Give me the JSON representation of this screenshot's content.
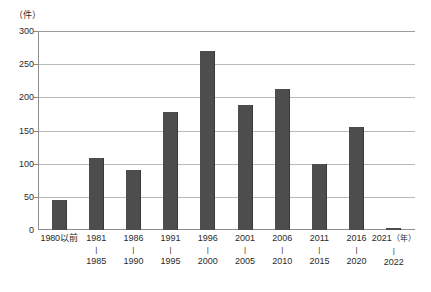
{
  "chart_data": {
    "type": "bar",
    "title": "",
    "xlabel": "（年）",
    "ylabel": "（件）",
    "ylim": [
      0,
      300
    ],
    "ytick_labels": [
      "300",
      "250",
      "200",
      "150",
      "100",
      "50",
      "0"
    ],
    "ytick_values": [
      300,
      250,
      200,
      150,
      100,
      50,
      0
    ],
    "grid": true,
    "legend": "none",
    "categories": [
      "1980以前",
      "1981\n1985",
      "1986\n1990",
      "1991\n1995",
      "1996\n2000",
      "2001\n2005",
      "2006\n2010",
      "2011\n2015",
      "2016\n2020",
      "2021\n2022"
    ],
    "values": [
      45,
      109,
      91,
      178,
      270,
      189,
      213,
      99,
      155,
      3
    ]
  },
  "axis": {
    "y_unit": "（件）",
    "x_unit": "（年）"
  },
  "x_groups": [
    {
      "start": "1980以前",
      "dash": "",
      "end": ""
    },
    {
      "start": "1981",
      "dash": "|",
      "end": "1985"
    },
    {
      "start": "1986",
      "dash": "|",
      "end": "1990"
    },
    {
      "start": "1991",
      "dash": "|",
      "end": "1995"
    },
    {
      "start": "1996",
      "dash": "|",
      "end": "2000"
    },
    {
      "start": "2001",
      "dash": "|",
      "end": "2005"
    },
    {
      "start": "2006",
      "dash": "|",
      "end": "2010"
    },
    {
      "start": "2011",
      "dash": "|",
      "end": "2015"
    },
    {
      "start": "2016",
      "dash": "|",
      "end": "2020"
    },
    {
      "start": "2021",
      "dash": "|",
      "end": "2022"
    }
  ],
  "colors": {
    "bar_fill": "#4d4d4d",
    "gridline": "#b9b9b9",
    "axis": "#8c8c8c",
    "text": "#2a2a2a",
    "background": "#ffffff"
  }
}
